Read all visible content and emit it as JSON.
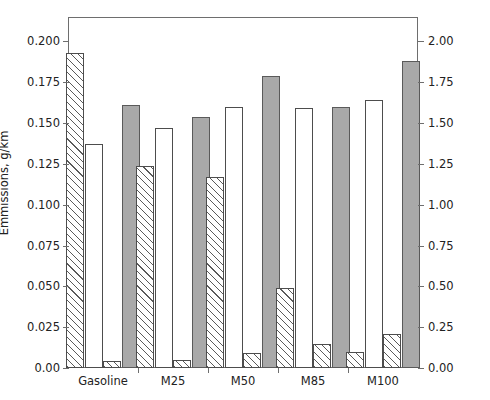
{
  "chart_data": {
    "type": "bar",
    "title": "",
    "subtitle": "",
    "xlabel": "",
    "ylabel": "Emmissions, g/km",
    "ylabel_right": "CO emmissions, g/km",
    "categories": [
      "Gasoline",
      "M25",
      "M50",
      "M85",
      "M100"
    ],
    "ylim": [
      0.0,
      0.215
    ],
    "ylim_right": [
      0.0,
      2.15
    ],
    "yticks": [
      0.0,
      0.025,
      0.05,
      0.075,
      0.1,
      0.125,
      0.15,
      0.175,
      0.2
    ],
    "ytick_labels": [
      "0.00",
      "0.025",
      "0.050",
      "0.075",
      "0.100",
      "0.125",
      "0.150",
      "0.175",
      "0.200"
    ],
    "yticks_right": [
      0.0,
      0.25,
      0.5,
      0.75,
      1.0,
      1.25,
      1.5,
      1.75,
      2.0
    ],
    "ytick_labels_right": [
      "0.00",
      "0.25",
      "0.50",
      "0.75",
      "1.00",
      "1.25",
      "1.50",
      "1.75",
      "2.00"
    ],
    "grid": false,
    "legend": "none",
    "axis_mapping": {
      "series_1_axis": "left",
      "series_2_axis": "left",
      "series_3_axis": "left",
      "series_4_axis": "right"
    },
    "series": [
      {
        "name": "series-1",
        "style": "hatched",
        "axis": "left",
        "values": [
          0.193,
          0.124,
          0.117,
          0.049,
          0.01
        ]
      },
      {
        "name": "series-2",
        "style": "open",
        "axis": "left",
        "values": [
          0.137,
          0.147,
          0.16,
          0.159,
          0.164
        ]
      },
      {
        "name": "series-3",
        "style": "hatched",
        "axis": "left",
        "values": [
          0.004,
          0.005,
          0.009,
          0.015,
          0.021
        ]
      },
      {
        "name": "series-4",
        "style": "solid-gray",
        "axis": "right",
        "values": [
          1.61,
          1.54,
          1.79,
          1.6,
          1.88
        ]
      }
    ]
  },
  "colors": {
    "frame": "#6e6e6e",
    "bar_outline": "#4d4d4d",
    "hatch_line": "#5a5a5a",
    "solid_fill": "#a9a9a9",
    "open_fill": "#ffffff",
    "text": "#222222",
    "background": "#ffffff"
  }
}
